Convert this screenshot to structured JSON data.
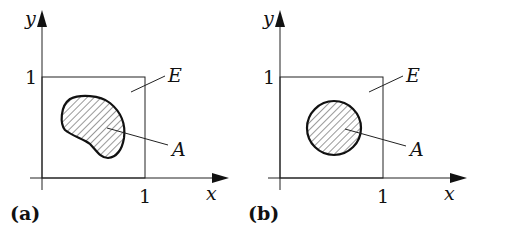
{
  "figure": {
    "panels": [
      {
        "id": "a",
        "label": "(a)",
        "axis_x_label": "x",
        "axis_y_label": "y",
        "tick_x": "1",
        "tick_y": "1",
        "square_label": "E",
        "region_label": "A",
        "region_shape": "irregular kidney-shaped hatched region"
      },
      {
        "id": "b",
        "label": "(b)",
        "axis_x_label": "x",
        "axis_y_label": "y",
        "tick_x": "1",
        "tick_y": "1",
        "square_label": "E",
        "region_label": "A",
        "region_shape": "hatched disk"
      }
    ],
    "colors": {
      "ink": "#111111",
      "background": "#ffffff"
    }
  }
}
